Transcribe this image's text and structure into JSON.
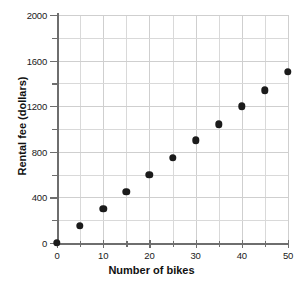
{
  "chart_data": {
    "type": "scatter",
    "title": "",
    "xlabel": "Number of bikes",
    "ylabel": "Rental fee (dollars)",
    "xlim": [
      0,
      50
    ],
    "ylim": [
      0,
      2000
    ],
    "grid": true,
    "legend": "none",
    "x_ticks_major": [
      0,
      10,
      20,
      30,
      40,
      50
    ],
    "x_ticks_minor": [
      5,
      15,
      25,
      35,
      45
    ],
    "y_ticks_major": [
      0,
      400,
      800,
      1200,
      1600,
      2000
    ],
    "y_ticks_minor": [
      200,
      600,
      1000,
      1400,
      1800
    ],
    "x_tick_labels": [
      "0",
      "10",
      "20",
      "30",
      "40",
      "50"
    ],
    "y_tick_labels": [
      "0",
      "400",
      "800",
      "1200",
      "1600",
      "2000"
    ],
    "x": [
      0,
      5,
      10,
      15,
      20,
      25,
      30,
      35,
      40,
      45,
      50
    ],
    "values": [
      0,
      150,
      300,
      450,
      600,
      750,
      900,
      1040,
      1200,
      1340,
      1500
    ],
    "marker_color": "#1b1b1b",
    "grid_color": "#d9d9d9",
    "axis_color": "#6e6e6e"
  }
}
